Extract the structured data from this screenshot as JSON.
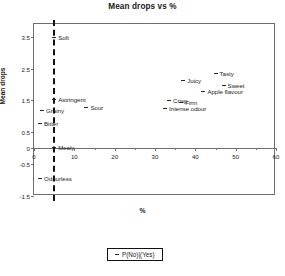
{
  "chart_data": {
    "type": "scatter",
    "title": "Mean drops vs %",
    "xlabel": "%",
    "ylabel": "Mean drops",
    "xlim": [
      0,
      60
    ],
    "ylim": [
      -1.5,
      3.9
    ],
    "xticks": [
      0,
      10,
      20,
      30,
      40,
      50,
      60
    ],
    "xtick_labels": [
      "0",
      "10",
      "20",
      "30",
      "40",
      "50",
      "60"
    ],
    "xminor_ticks": [
      5,
      15,
      25,
      35,
      45,
      55
    ],
    "yticks": [
      3.5,
      2.5,
      1.5,
      0.5,
      0,
      -0.5,
      -1.5
    ],
    "ytick_labels": [
      "3.5",
      "2.5",
      "1.5",
      "0.5",
      "0",
      "-0.5",
      "-1.5"
    ],
    "grid": false,
    "legend": {
      "position": "below-plot",
      "entries": [
        {
          "label": "P(No)|(Yes)",
          "marker": "dash"
        }
      ]
    },
    "reference_line": {
      "orientation": "vertical",
      "x": 4.8,
      "style": "dashed",
      "color": "#111111"
    },
    "points": [
      {
        "label": "Soft",
        "x": 5.0,
        "y": 3.5,
        "label_side": "right"
      },
      {
        "label": "Astringent",
        "x": 5.0,
        "y": 1.55,
        "label_side": "right"
      },
      {
        "label": "Grainy",
        "x": 2.0,
        "y": 1.2,
        "label_side": "right"
      },
      {
        "label": "Bitter",
        "x": 1.5,
        "y": 0.8,
        "label_side": "right"
      },
      {
        "label": "Mealy",
        "x": 5.0,
        "y": 0.05,
        "label_side": "right"
      },
      {
        "label": "Odourless",
        "x": 1.5,
        "y": -0.95,
        "label_side": "right"
      },
      {
        "label": "Sour",
        "x": 13.0,
        "y": 1.3,
        "label_side": "right"
      },
      {
        "label": "Intense odour",
        "x": 32.5,
        "y": 1.27,
        "label_side": "right"
      },
      {
        "label": "Crisp",
        "x": 33.5,
        "y": 1.5,
        "label_side": "right"
      },
      {
        "label": "Firm",
        "x": 36.5,
        "y": 1.45,
        "label_side": "right"
      },
      {
        "label": "Juicy",
        "x": 37.0,
        "y": 2.15,
        "label_side": "right"
      },
      {
        "label": "Apple flavour",
        "x": 42.0,
        "y": 1.8,
        "label_side": "right"
      },
      {
        "label": "Tasty",
        "x": 45.0,
        "y": 2.35,
        "label_side": "right"
      },
      {
        "label": "Sweet",
        "x": 47.0,
        "y": 2.0,
        "label_side": "right"
      }
    ],
    "colors": {
      "marker": "#262626",
      "frame": "#6f6f6f",
      "refline": "#111111"
    }
  }
}
